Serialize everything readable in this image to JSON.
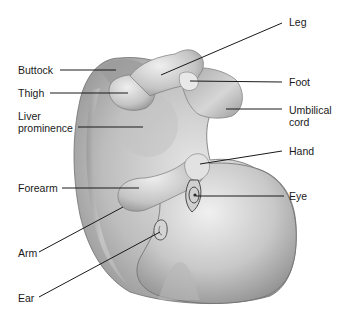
{
  "diagram": {
    "line_color": "#1a1a1a",
    "labels": {
      "buttock": "Buttock",
      "thigh": "Thigh",
      "liver_prominence": "Liver\nprominence",
      "leg": "Leg",
      "foot": "Foot",
      "umbilical_cord": "Umbilical\ncord",
      "hand": "Hand",
      "forearm": "Forearm",
      "eye": "Eye",
      "arm": "Arm",
      "ear": "Ear"
    }
  }
}
